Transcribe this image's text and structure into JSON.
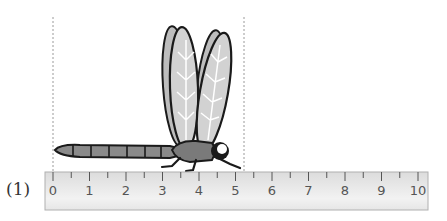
{
  "problem": {
    "label": "(1)",
    "subject": "dragonfly",
    "measured_start_cm": 0,
    "measured_end_cm": 5.2
  },
  "ruler": {
    "unit": "cm",
    "min": 0,
    "max": 10,
    "tick_labels": [
      "0",
      "1",
      "2",
      "3",
      "4",
      "5",
      "6",
      "7",
      "8",
      "9",
      "10"
    ],
    "minor_divisions": 2
  },
  "colors": {
    "outline": "#1a1a1a",
    "wing_fill": "#cfcfcf",
    "body_fill": "#8a8a8a",
    "ruler_fill": "#e4e4e4",
    "guide_line": "#9a9a9a"
  }
}
